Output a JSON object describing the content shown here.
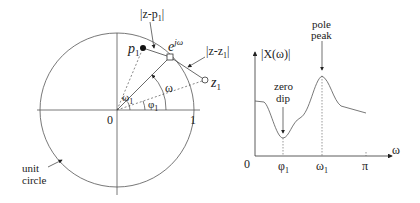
{
  "left_panel": {
    "labels": {
      "p1": "p",
      "p1_sub": "1",
      "z1": "z",
      "z1_sub": "1",
      "ejw_base": "e",
      "ejw_sup": "jω",
      "dist_p": "|z-p",
      "dist_p_sub": "1",
      "dist_p_end": "|",
      "dist_z": "|z-z",
      "dist_z_sub": "1",
      "dist_z_end": "|",
      "omega": "ω",
      "omega1": "ω",
      "omega1_sub": "1",
      "phi1": "φ",
      "phi1_sub": "1",
      "origin": "0",
      "one": "1",
      "unit_line1": "unit",
      "unit_line2": "circle"
    }
  },
  "right_panel": {
    "y_axis_label": "|X(ω)|",
    "x_axis_label": "ω",
    "origin": "0",
    "tick_phi": "φ",
    "tick_phi_sub": "1",
    "tick_omega": "ω",
    "tick_omega_sub": "1",
    "tick_pi": "π",
    "zero_line1": "zero",
    "zero_line2": "dip",
    "pole_line1": "pole",
    "pole_line2": "peak"
  },
  "colors": {
    "stroke": "#333333",
    "text": "#222222"
  }
}
